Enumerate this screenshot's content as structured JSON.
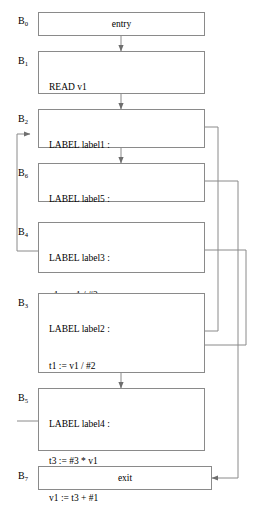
{
  "diagram": {
    "stroke_color": "#8a8a8a",
    "text_color": "#000000",
    "background": "#ffffff"
  },
  "blocks": [
    {
      "id": "b0",
      "label": "B",
      "subscript": "0",
      "centered": true,
      "lines": [
        "entry"
      ]
    },
    {
      "id": "b1",
      "label": "B",
      "subscript": "1",
      "centered": false,
      "lines": [
        "READ v1",
        "v2 := #0"
      ]
    },
    {
      "id": "b2",
      "label": "B",
      "subscript": "2",
      "centered": false,
      "lines": [
        "LABEL label1 :",
        "IF v1 > #1 GOTO label2"
      ]
    },
    {
      "id": "b6",
      "label": "B",
      "subscript": "6",
      "centered": false,
      "lines": [
        "LABEL label5 :",
        "RETURN #0"
      ]
    },
    {
      "id": "b4",
      "label": "B",
      "subscript": "4",
      "centered": false,
      "lines": [
        "LABEL label3 :",
        "v1 := v1 / #2",
        "GOTO label1"
      ]
    },
    {
      "id": "b3",
      "label": "B",
      "subscript": "3",
      "centered": false,
      "lines": [
        "LABEL label2 :",
        "t1 := v1 / #2",
        "t2 := t1 * #2",
        "v2 := v1 − t2",
        "IF v2 == #0 GOTO label3"
      ]
    },
    {
      "id": "b5",
      "label": "B",
      "subscript": "5",
      "centered": false,
      "lines": [
        "LABEL label4 :",
        "t3 := #3 * v1",
        "v1 := t3 + #1",
        "GOTO label1"
      ]
    },
    {
      "id": "b7",
      "label": "B",
      "subscript": "7",
      "centered": true,
      "lines": [
        "exit"
      ]
    }
  ],
  "edges": [
    {
      "name": "b0-to-b1",
      "from": "b0",
      "to": "b1",
      "kind": "fallthrough-down"
    },
    {
      "name": "b1-to-b2",
      "from": "b1",
      "to": "b2",
      "kind": "fallthrough-down"
    },
    {
      "name": "b2-to-b6",
      "from": "b2",
      "to": "b6",
      "kind": "fallthrough-down"
    },
    {
      "name": "b2-to-b3-taken-branch",
      "from": "b2",
      "to": "b3",
      "kind": "right-channel"
    },
    {
      "name": "b6-to-b7-return",
      "from": "b6",
      "to": "b7",
      "kind": "right-channel"
    },
    {
      "name": "b3-to-b4-taken-branch",
      "from": "b3",
      "to": "b4",
      "kind": "right-channel-outer"
    },
    {
      "name": "b3-to-b5",
      "from": "b3",
      "to": "b5",
      "kind": "fallthrough-down"
    },
    {
      "name": "b4-to-b2-goto-label1",
      "from": "b4",
      "to": "b2",
      "kind": "left-channel"
    },
    {
      "name": "b5-to-b2-goto-label1",
      "from": "b5",
      "to": "b2",
      "kind": "left-channel"
    }
  ]
}
